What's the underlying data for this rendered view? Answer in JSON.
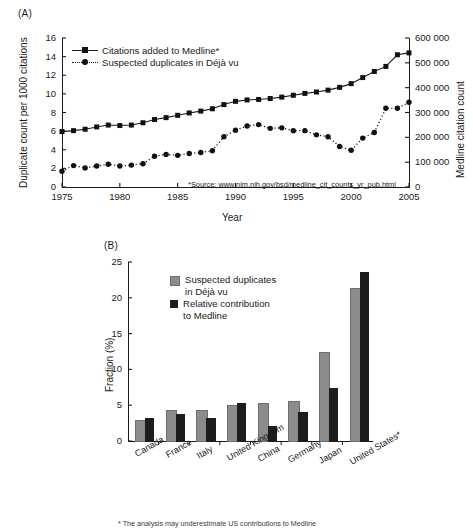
{
  "figure": {
    "panelA_label": "(A)",
    "panelB_label": "(B)"
  },
  "panelA": {
    "xlabel": "Year",
    "ylabel_left": "Duplicate count per 1000 citations",
    "ylabel_right": "Medline citation count",
    "source_note": "*Source: www.nlm.nih.gov/bsd/medline_cit_counts_yr_pub.html",
    "legend": [
      {
        "label": "Citations added to Medline*",
        "marker": "square",
        "line": "solid"
      },
      {
        "label": "Suspected duplicates in Déjà vu",
        "marker": "circle",
        "line": "dotted"
      }
    ],
    "xticks": [
      "1975",
      "1980",
      "1985",
      "1990",
      "1995",
      "2000",
      "2005"
    ],
    "yticks_left": [
      "0",
      "2",
      "4",
      "6",
      "8",
      "10",
      "12",
      "14",
      "16"
    ],
    "yticks_right": [
      "0",
      "100 000",
      "200 000",
      "300 000",
      "400 000",
      "500 000",
      "600 000"
    ]
  },
  "panelB": {
    "ylabel": "Fraction (%)",
    "yticks": [
      "0",
      "5",
      "10",
      "15",
      "20",
      "25"
    ],
    "legend": [
      {
        "label_line1": "Suspected duplicates",
        "label_line2": "in Déjà vu",
        "color": "#8c8c8c"
      },
      {
        "label_line1": "Relative contribution",
        "label_line2": "to Medline",
        "color": "#1d1d1d"
      }
    ],
    "footnote": "* The analysis may underestimate US contributions to Medline"
  },
  "chart_data": [
    {
      "type": "line",
      "title": "(A) Duplicate citations and Medline growth, 1975-2005",
      "xlabel": "Year",
      "ylabel": "Duplicate count per 1000 citations",
      "ylabel_right": "Medline citation count",
      "xlim": [
        1975,
        2005
      ],
      "ylim": [
        0,
        16
      ],
      "ylim_right": [
        0,
        600000
      ],
      "grid": false,
      "legend_position": "upper-left",
      "x": [
        1975,
        1976,
        1977,
        1978,
        1979,
        1980,
        1981,
        1982,
        1983,
        1984,
        1985,
        1986,
        1987,
        1988,
        1989,
        1990,
        1991,
        1992,
        1993,
        1994,
        1995,
        1996,
        1997,
        1998,
        1999,
        2000,
        2001,
        2002,
        2003,
        2004,
        2005
      ],
      "series": [
        {
          "name": "Citations added to Medline*",
          "marker": "square",
          "line": "solid",
          "axis": "right",
          "values_left_scale": [
            5.95,
            6.05,
            6.2,
            6.45,
            6.65,
            6.6,
            6.65,
            6.9,
            7.25,
            7.45,
            7.7,
            7.95,
            8.15,
            8.4,
            8.85,
            9.2,
            9.35,
            9.4,
            9.5,
            9.65,
            9.85,
            10.05,
            10.2,
            10.4,
            10.7,
            11.1,
            11.75,
            12.4,
            12.95,
            14.2,
            14.4
          ],
          "values": [
            223000,
            227000,
            233000,
            242000,
            249000,
            248000,
            249000,
            259000,
            272000,
            279000,
            289000,
            298000,
            306000,
            315000,
            332000,
            345000,
            351000,
            353000,
            356000,
            362000,
            369000,
            377000,
            383000,
            390000,
            401000,
            416000,
            441000,
            465000,
            486000,
            533000,
            600000
          ]
        },
        {
          "name": "Suspected duplicates in Déjà vu",
          "marker": "circle",
          "line": "dotted",
          "axis": "left",
          "values": [
            1.7,
            2.3,
            2.05,
            2.25,
            2.45,
            2.25,
            2.35,
            2.5,
            3.3,
            3.5,
            3.4,
            3.6,
            3.7,
            3.9,
            5.4,
            6.1,
            6.55,
            6.7,
            6.3,
            6.35,
            6.05,
            6.05,
            5.6,
            5.4,
            4.35,
            3.95,
            5.25,
            5.85,
            8.45,
            8.45,
            9.1
          ]
        }
      ],
      "annotations": [
        "*Source: www.nlm.nih.gov/bsd/medline_cit_counts_yr_pub.html"
      ]
    },
    {
      "type": "bar",
      "title": "(B) Suspected duplicates vs relative contribution to Medline, by country",
      "xlabel": "",
      "ylabel": "Fraction (%)",
      "ylim": [
        0,
        25
      ],
      "grid": false,
      "legend_position": "upper-left",
      "categories": [
        "Canada",
        "France",
        "Italy",
        "United Kingdom",
        "China",
        "Germany",
        "Japan",
        "United States*"
      ],
      "series": [
        {
          "name": "Suspected duplicates in Déjà vu",
          "color": "#8c8c8c",
          "values": [
            2.8,
            4.2,
            4.2,
            4.9,
            5.2,
            5.5,
            12.3,
            21.2
          ]
        },
        {
          "name": "Relative contribution to Medline",
          "color": "#1d1d1d",
          "values": [
            3.4,
            3.9,
            3.3,
            5.5,
            2.3,
            4.2,
            7.5,
            23.8
          ]
        }
      ],
      "annotations": [
        "* The analysis may underestimate US contributions to Medline"
      ]
    }
  ]
}
